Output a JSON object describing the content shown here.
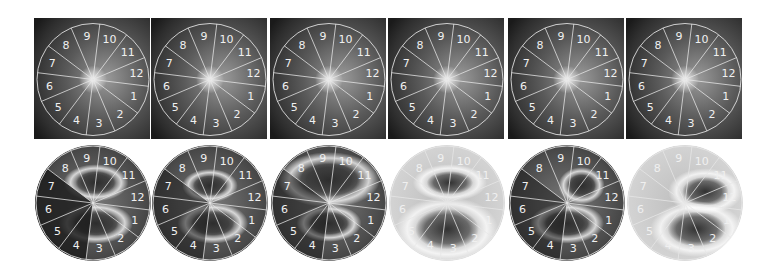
{
  "figure": {
    "rows": [
      {
        "name": "fundus-images-with-sector-overlay",
        "panels": [
          {
            "index": 1,
            "sector_labels": [
              "1",
              "2",
              "3",
              "4",
              "5",
              "6",
              "7",
              "8",
              "9",
              "10",
              "11",
              "12"
            ]
          },
          {
            "index": 2,
            "sector_labels": [
              "1",
              "2",
              "3",
              "4",
              "5",
              "6",
              "7",
              "8",
              "9",
              "10",
              "11",
              "12"
            ]
          },
          {
            "index": 3,
            "sector_labels": [
              "1",
              "2",
              "3",
              "4",
              "5",
              "6",
              "7",
              "8",
              "9",
              "10",
              "11",
              "12"
            ]
          },
          {
            "index": 4,
            "sector_labels": [
              "1",
              "2",
              "3",
              "4",
              "5",
              "6",
              "7",
              "8",
              "9",
              "10",
              "11",
              "12"
            ]
          },
          {
            "index": 5,
            "sector_labels": [
              "1",
              "2",
              "3",
              "4",
              "5",
              "6",
              "7",
              "8",
              "9",
              "10",
              "11",
              "12"
            ]
          },
          {
            "index": 6,
            "sector_labels": [
              "1",
              "2",
              "3",
              "4",
              "5",
              "6",
              "7",
              "8",
              "9",
              "10",
              "11",
              "12"
            ]
          }
        ]
      },
      {
        "name": "heatmaps-with-sector-overlay",
        "panels": [
          {
            "index": 1,
            "sector_labels": [
              "1",
              "2",
              "3",
              "4",
              "5",
              "6",
              "7",
              "8",
              "9",
              "10",
              "11",
              "12"
            ]
          },
          {
            "index": 2,
            "sector_labels": [
              "1",
              "2",
              "3",
              "4",
              "5",
              "6",
              "7",
              "8",
              "9",
              "10",
              "11",
              "12"
            ]
          },
          {
            "index": 3,
            "sector_labels": [
              "1",
              "2",
              "3",
              "4",
              "5",
              "6",
              "7",
              "8",
              "9",
              "10",
              "11",
              "12"
            ]
          },
          {
            "index": 4,
            "sector_labels": [
              "1",
              "2",
              "3",
              "4",
              "5",
              "6",
              "7",
              "8",
              "9",
              "10",
              "11",
              "12"
            ]
          },
          {
            "index": 5,
            "sector_labels": [
              "1",
              "2",
              "3",
              "4",
              "5",
              "6",
              "7",
              "8",
              "9",
              "10",
              "11",
              "12"
            ]
          },
          {
            "index": 6,
            "sector_labels": [
              "1",
              "2",
              "3",
              "4",
              "5",
              "6",
              "7",
              "8",
              "9",
              "10",
              "11",
              "12"
            ]
          }
        ]
      }
    ],
    "colors": {
      "overlay_line": "#e8e8e8",
      "label_text": "#f0f0f0",
      "fundus_dark": "#1a1a1a",
      "fundus_mid": "#5a5a5a",
      "heat_dark": "#2a2a2a",
      "heat_light": "#d8d8d8"
    }
  }
}
